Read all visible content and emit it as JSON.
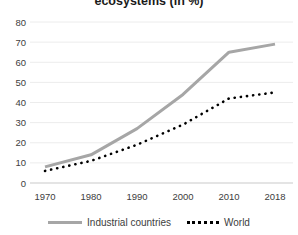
{
  "title": "ecosystems (in %)",
  "colors": {
    "industrial": "#a6a6a6",
    "world": "#000000",
    "grid": "#ececec",
    "axis_line": "#c9c9c9",
    "tick_text": "#404040",
    "title_text": "#1a1a1a",
    "background": "#ffffff"
  },
  "chart_data": {
    "type": "line",
    "title": "ecosystems (in %)",
    "categories": [
      "1970",
      "1980",
      "1990",
      "2000",
      "2010",
      "2018"
    ],
    "series": [
      {
        "name": "Industrial countries",
        "style": "solid",
        "color": "#a6a6a6",
        "values": [
          8,
          14,
          27,
          44,
          65,
          69
        ]
      },
      {
        "name": "World",
        "style": "dotted",
        "color": "#000000",
        "values": [
          6,
          11,
          19,
          29,
          42,
          45
        ]
      }
    ],
    "ylim": [
      0,
      80
    ],
    "ytick_step": 10,
    "yticks": [
      0,
      10,
      20,
      30,
      40,
      50,
      60,
      70,
      80
    ],
    "xlabel": "",
    "ylabel": "",
    "grid": true,
    "legend_position": "bottom"
  }
}
